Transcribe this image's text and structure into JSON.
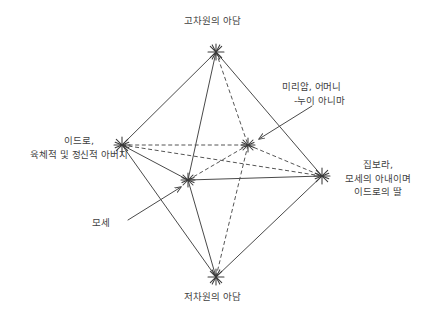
{
  "diagram": {
    "title_text": "고차원의 아담",
    "background_color": "#ffffff",
    "line_color": "#4a4a4a",
    "text_color": "#3f3f3f",
    "nodes": [
      {
        "id": "high_adam",
        "label": "고차원의 아담",
        "x": 216,
        "y": 52,
        "glyph": "asterisk"
      },
      {
        "id": "jethro",
        "label": "이드로,\n육체적 및 정신적 아버지",
        "x": 122,
        "y": 145,
        "glyph": "asterisk"
      },
      {
        "id": "zipporah",
        "label": "집보라,\n모세의 아내이며\n이드로의 딸",
        "x": 322,
        "y": 176,
        "glyph": "asterisk"
      },
      {
        "id": "low_adam",
        "label": "저차원의 아담",
        "x": 216,
        "y": 277,
        "glyph": "asterisk"
      },
      {
        "id": "miriam",
        "label": "미리암, 어머니\n-누이 아니마",
        "x": 248,
        "y": 145,
        "glyph": "asterisk"
      },
      {
        "id": "moses",
        "label": "모세",
        "x": 188,
        "y": 180,
        "glyph": "asterisk"
      }
    ],
    "labels": {
      "top": "고차원의 아담",
      "bottom": "저차원의 아담",
      "left_line1": "이드로,",
      "left_line2": "육체적 및 정신적 아버지",
      "right_line1": "집보라,",
      "right_line2": "모세의 아내이며",
      "right_line3": "이드로의 딸",
      "miriam_line1": "미리암, 어머니",
      "miriam_line2": "-누이 아니마",
      "moses": "모세"
    },
    "edges": [
      {
        "from": "high_adam",
        "to": "jethro",
        "style": "solid"
      },
      {
        "from": "high_adam",
        "to": "zipporah",
        "style": "solid"
      },
      {
        "from": "low_adam",
        "to": "jethro",
        "style": "solid"
      },
      {
        "from": "low_adam",
        "to": "zipporah",
        "style": "solid"
      },
      {
        "from": "high_adam",
        "to": "moses",
        "style": "solid"
      },
      {
        "from": "low_adam",
        "to": "moses",
        "style": "solid"
      },
      {
        "from": "jethro",
        "to": "moses",
        "style": "solid"
      },
      {
        "from": "moses",
        "to": "zipporah",
        "style": "solid"
      },
      {
        "from": "high_adam",
        "to": "miriam",
        "style": "dashed"
      },
      {
        "from": "low_adam",
        "to": "miriam",
        "style": "dashed"
      },
      {
        "from": "jethro",
        "to": "miriam",
        "style": "dashed"
      },
      {
        "from": "miriam",
        "to": "zipporah",
        "style": "dashed"
      },
      {
        "from": "jethro",
        "to": "zipporah",
        "style": "dashed"
      },
      {
        "from": "moses",
        "to": "miriam",
        "style": "dashed"
      }
    ],
    "annotation_arrows": [
      {
        "id": "miriam-arrow",
        "from_x": 312,
        "from_y": 106,
        "to_x": 259,
        "to_y": 139
      },
      {
        "id": "moses-arrow",
        "from_x": 128,
        "from_y": 220,
        "to_x": 181,
        "to_y": 187
      }
    ]
  }
}
